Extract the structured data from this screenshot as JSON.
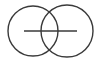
{
  "diagram": {
    "type": "overlapping-circles",
    "background": "#ffffff",
    "stroke_color": "#3a3a3a",
    "circles": [
      {
        "name": "left-circle",
        "cx": 33,
        "cy": 31,
        "r": 25
      },
      {
        "name": "right-circle",
        "cx": 67,
        "cy": 31,
        "r": 26
      }
    ],
    "line": {
      "x1": 24,
      "y1": 31,
      "x2": 77,
      "y2": 31
    }
  }
}
